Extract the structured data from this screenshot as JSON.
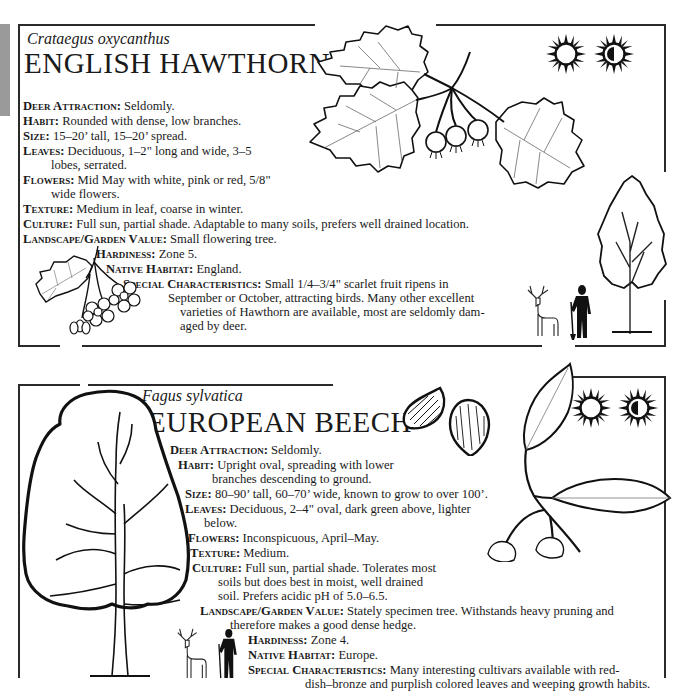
{
  "plants": [
    {
      "scientific_name": "Crataegus oxycanthus",
      "common_name": "ENGLISH HAWTHORN",
      "sun_icons": [
        "full-sun-icon",
        "partial-shade-icon"
      ],
      "facts": [
        {
          "label": "Deer Attraction:",
          "value": "Seldomly."
        },
        {
          "label": "Habit:",
          "value": "Rounded with dense, low branches."
        },
        {
          "label": "Size:",
          "value": "15–20’ tall, 15–20’ spread."
        },
        {
          "label": "Leaves:",
          "value": "Deciduous, 1–2\" long and wide, 3–5",
          "cont": "lobes, serrated."
        },
        {
          "label": "Flowers:",
          "value": "Mid May with white, pink or red, 5/8\"",
          "cont": "wide flowers."
        },
        {
          "label": "Texture:",
          "value": "Medium in leaf, coarse in winter."
        },
        {
          "label": "Culture:",
          "value": "Full sun, partial shade. Adaptable to many soils, prefers well drained location."
        },
        {
          "label": "Landscape/Garden Value:",
          "value": "Small flowering tree."
        },
        {
          "label": "Hardiness:",
          "value": "Zone 5."
        },
        {
          "label": "Native Habitat:",
          "value": "England."
        },
        {
          "label": "Special Characteristics:",
          "value": "Small 1/4–3/4\" scarlet fruit ripens in",
          "cont": "September or October, attracting birds. Many other excellent",
          "cont2": "varieties of Hawthorn are available, most are seldomly dam-",
          "cont3": "aged by deer."
        }
      ]
    },
    {
      "scientific_name": "Fagus sylvatica",
      "common_name": "EUROPEAN BEECH",
      "sun_icons": [
        "full-sun-icon",
        "partial-shade-icon"
      ],
      "facts": [
        {
          "label": "Deer Attraction:",
          "value": "Seldomly."
        },
        {
          "label": "Habit:",
          "value": "Upright oval, spreading with lower",
          "cont": "branches descending to ground."
        },
        {
          "label": "Size:",
          "value": "80–90’ tall, 60–70’ wide, known to grow to over 100’."
        },
        {
          "label": "Leaves:",
          "value": "Deciduous, 2–4\" oval, dark green above, lighter",
          "cont": "below."
        },
        {
          "label": "Flowers:",
          "value": "Inconspicuous, April–May."
        },
        {
          "label": "Texture:",
          "value": "Medium."
        },
        {
          "label": "Culture:",
          "value": "Full sun, partial shade. Tolerates most",
          "cont": "soils but does best in moist, well drained",
          "cont2": "soil. Prefers acidic pH of 5.0–6.5."
        },
        {
          "label": "Landscape/Garden Value:",
          "value": "Stately specimen tree. Withstands heavy pruning and",
          "cont": "therefore makes a good dense hedge."
        },
        {
          "label": "Hardiness:",
          "value": "Zone 4."
        },
        {
          "label": "Native Habitat:",
          "value": "Europe."
        },
        {
          "label": "Special Characteristics:",
          "value": "Many interesting cultivars available with red-",
          "cont": "dish–bronze and purplish colored leaves and weeping growth habits."
        }
      ]
    }
  ]
}
